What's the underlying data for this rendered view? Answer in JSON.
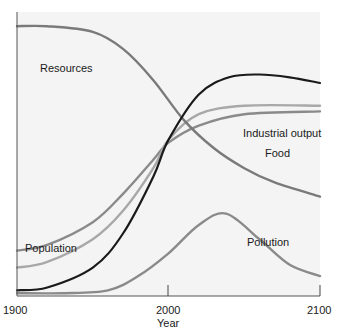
{
  "chart_data": {
    "type": "line",
    "title": "",
    "xlabel": "Year",
    "ylabel": "",
    "x_ticks": [
      "1900",
      "2000",
      "2100"
    ],
    "xlim": [
      1900,
      2100
    ],
    "grid": false,
    "legend": "inline labels",
    "series": [
      {
        "name": "Resources",
        "color": "#7a7a7a",
        "x": [
          1900,
          1920,
          1950,
          1970,
          1990,
          2010,
          2030,
          2050,
          2070,
          2100
        ],
        "y": [
          0.95,
          0.95,
          0.93,
          0.87,
          0.76,
          0.62,
          0.52,
          0.45,
          0.4,
          0.35
        ]
      },
      {
        "name": "Industrial output",
        "color": "#1a1a1a",
        "x": [
          1900,
          1920,
          1950,
          1970,
          1990,
          2000,
          2020,
          2040,
          2060,
          2080,
          2100
        ],
        "y": [
          0.02,
          0.03,
          0.1,
          0.22,
          0.42,
          0.55,
          0.71,
          0.77,
          0.78,
          0.77,
          0.75
        ]
      },
      {
        "name": "Food",
        "color": "#a8a8a8",
        "x": [
          1900,
          1920,
          1950,
          1970,
          1990,
          2000,
          2020,
          2050,
          2100
        ],
        "y": [
          0.1,
          0.12,
          0.2,
          0.3,
          0.45,
          0.55,
          0.64,
          0.67,
          0.67
        ]
      },
      {
        "name": "Population",
        "color": "#8a8a8a",
        "x": [
          1900,
          1920,
          1950,
          1970,
          1990,
          2000,
          2020,
          2050,
          2100
        ],
        "y": [
          0.16,
          0.18,
          0.26,
          0.36,
          0.48,
          0.54,
          0.6,
          0.64,
          0.65
        ]
      },
      {
        "name": "Pollution",
        "color": "#8a8a8a",
        "x": [
          1900,
          1930,
          1960,
          1980,
          2000,
          2020,
          2038,
          2060,
          2080,
          2100
        ],
        "y": [
          0.01,
          0.01,
          0.02,
          0.07,
          0.15,
          0.25,
          0.29,
          0.2,
          0.11,
          0.07
        ]
      }
    ],
    "annotations": [
      "Resources",
      "Industrial output",
      "Food",
      "Population",
      "Pollution"
    ]
  },
  "labels": {
    "resources": "Resources",
    "industrial_output": "Industrial output",
    "food": "Food",
    "population": "Population",
    "pollution": "Pollution",
    "x_axis_title": "Year",
    "tick_1900": "1900",
    "tick_2000": "2000",
    "tick_2100": "2100"
  }
}
